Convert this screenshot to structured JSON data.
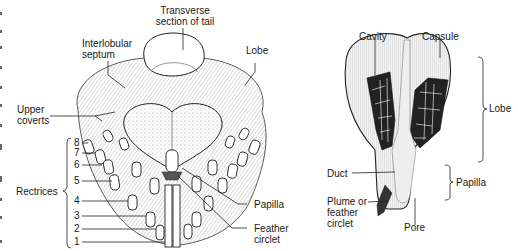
{
  "left_figure": {
    "labels": {
      "transverse_section": "Transverse\nsection of tail",
      "transverse_line1": "Transverse",
      "transverse_line2": "section of tail",
      "interlobular_line1": "Interlobular",
      "interlobular_line2": "septum",
      "lobe": "Lobe",
      "upper_coverts_line1": "Upper",
      "upper_coverts_line2": "coverts",
      "rectrices": "Rectrices",
      "papilla": "Papilla",
      "feather_circlet_line1": "Feather",
      "feather_circlet_line2": "circlet"
    },
    "rectrix_numbers": [
      "8",
      "7",
      "6",
      "5",
      "4",
      "3",
      "2",
      "1"
    ]
  },
  "right_figure": {
    "labels": {
      "cavity": "Cavity",
      "capsule": "Capsule",
      "lobe": "Lobe",
      "papilla": "Papilla",
      "duct": "Duct",
      "plume_line1": "Plume or",
      "plume_line2": "feather",
      "plume_line3": "circlet",
      "pore": "Pore"
    }
  },
  "colors": {
    "ink": "#1a1a1a",
    "background": "#ffffff",
    "shade": "#cfcfcf",
    "dark_fill": "#222222"
  }
}
